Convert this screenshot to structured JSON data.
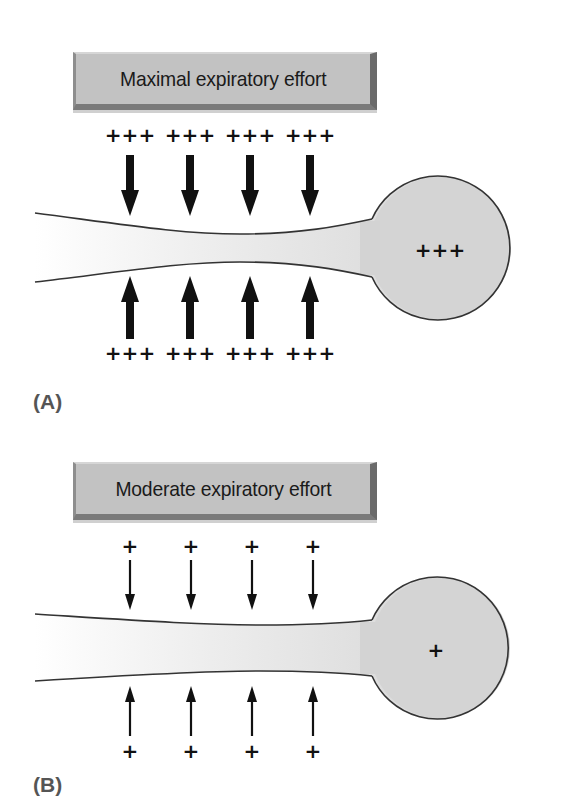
{
  "figure": {
    "panels": [
      {
        "id": "A",
        "label": "(A)",
        "effort_label": "Maximal expiratory effort",
        "external_pressure_top": [
          "+++",
          "+++",
          "+++",
          "+++"
        ],
        "external_pressure_bottom": [
          "+++",
          "+++",
          "+++",
          "+++"
        ],
        "alveolar_pressure": "+++",
        "arrow_style": "thick",
        "airway_state": "compressed"
      },
      {
        "id": "B",
        "label": "(B)",
        "effort_label": "Moderate expiratory effort",
        "external_pressure_top": [
          "+",
          "+",
          "+",
          "+"
        ],
        "external_pressure_bottom": [
          "+",
          "+",
          "+",
          "+"
        ],
        "alveolar_pressure": "+",
        "arrow_style": "thin",
        "airway_state": "patent"
      }
    ]
  },
  "colors": {
    "box_face": "#c2c2c2",
    "alveolus_fill": "#d4d4d4",
    "outline": "#333333",
    "arrow": "#111111",
    "label": "#555555"
  }
}
